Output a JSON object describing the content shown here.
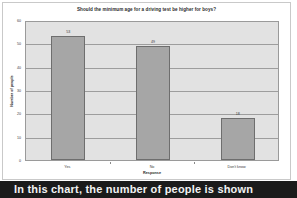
{
  "chart_data": {
    "type": "bar",
    "title": "Should the minimum age for a driving test be higher for boys?",
    "xlabel": "Response",
    "ylabel": "Number of people",
    "categories": [
      "Yes",
      "No",
      "Don't know"
    ],
    "values": [
      53,
      49,
      18
    ],
    "value_labels": [
      "53",
      "49",
      "18"
    ],
    "ylim": [
      0,
      60
    ],
    "yticks": [
      0,
      10,
      20,
      30,
      40,
      50,
      60
    ],
    "ytick_labels": [
      "0",
      "10",
      "20",
      "30",
      "40",
      "50",
      "60"
    ],
    "grid": true,
    "legend": false,
    "legend_position": "none",
    "colors": {
      "bar_fill": "#a6a6a6",
      "bar_border": "#6e6e6e",
      "plot_background": "#e2e2e2",
      "gridline": "#9d9d9d",
      "text": "#3a3a3a",
      "banner_background": "#1b1b1b",
      "banner_text": "#f2f2f2"
    }
  },
  "caption": {
    "text": "In this chart, the number of people is shown"
  }
}
